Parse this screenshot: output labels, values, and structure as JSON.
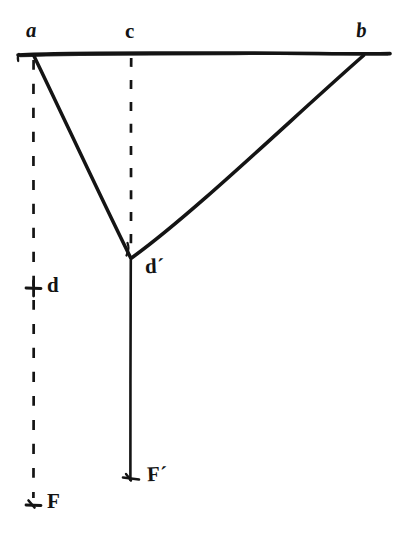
{
  "figure": {
    "kind": "hand-drawn-geometry-diagram",
    "background_color": "#ffffff",
    "ink_color": "#141414",
    "width": 396,
    "height": 541,
    "labels": {
      "a": "a",
      "c": "c",
      "b": "b",
      "d_prime": "d´",
      "d": "d",
      "F": "F",
      "F_prime": "F´"
    },
    "points": {
      "a": {
        "x": 34,
        "y": 55
      },
      "c": {
        "x": 131,
        "y": 55
      },
      "b": {
        "x": 364,
        "y": 55
      },
      "d_prime": {
        "x": 131,
        "y": 258
      },
      "d_tick": {
        "x": 34,
        "y": 288
      },
      "F": {
        "x": 34,
        "y": 505
      },
      "F_prime": {
        "x": 131,
        "y": 480
      }
    },
    "strokes": [
      {
        "name": "baseline-ab",
        "style": "solid",
        "from": "left-edge",
        "to": "right-edge"
      },
      {
        "name": "segment-a-dprime",
        "style": "solid",
        "from": "a",
        "to": "d_prime"
      },
      {
        "name": "segment-b-dprime",
        "style": "solid",
        "from": "b",
        "to": "d_prime"
      },
      {
        "name": "ray-dprime-Fprime",
        "style": "solid",
        "from": "d_prime",
        "to": "F_prime"
      },
      {
        "name": "dashed-c-dprime",
        "style": "dashed",
        "from": "c",
        "to": "d_prime"
      },
      {
        "name": "dashed-a-F",
        "style": "dashed",
        "from": "a",
        "to": "F"
      }
    ],
    "tick_marks": [
      {
        "name": "tick-d",
        "at": "d_tick"
      },
      {
        "name": "tick-F",
        "at": "F"
      },
      {
        "name": "tick-Fprime",
        "at": "F_prime"
      }
    ]
  }
}
